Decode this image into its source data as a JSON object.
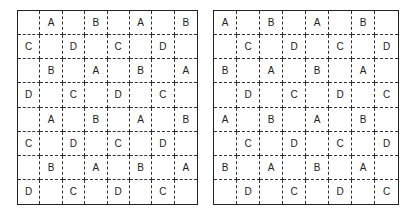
{
  "grids": [
    {
      "name": "left-grid",
      "rows": [
        [
          "",
          "A",
          "",
          "B",
          "",
          "A",
          "",
          "B"
        ],
        [
          "C",
          "",
          "D",
          "",
          "C",
          "",
          "D",
          ""
        ],
        [
          "",
          "B",
          "",
          "A",
          "",
          "B",
          "",
          "A"
        ],
        [
          "D",
          "",
          "C",
          "",
          "D",
          "",
          "C",
          ""
        ],
        [
          "",
          "A",
          "",
          "B",
          "",
          "A",
          "",
          "B"
        ],
        [
          "C",
          "",
          "D",
          "",
          "C",
          "",
          "D",
          ""
        ],
        [
          "",
          "B",
          "",
          "A",
          "",
          "B",
          "",
          "A"
        ],
        [
          "D",
          "",
          "C",
          "",
          "D",
          "",
          "C",
          ""
        ]
      ]
    },
    {
      "name": "right-grid",
      "rows": [
        [
          "A",
          "",
          "B",
          "",
          "A",
          "",
          "B",
          ""
        ],
        [
          "",
          "C",
          "",
          "D",
          "",
          "C",
          "",
          "D"
        ],
        [
          "B",
          "",
          "A",
          "",
          "B",
          "",
          "A",
          ""
        ],
        [
          "",
          "D",
          "",
          "C",
          "",
          "D",
          "",
          "C"
        ],
        [
          "A",
          "",
          "B",
          "",
          "A",
          "",
          "B",
          ""
        ],
        [
          "",
          "C",
          "",
          "D",
          "",
          "C",
          "",
          "D"
        ],
        [
          "B",
          "",
          "A",
          "",
          "B",
          "",
          "A",
          ""
        ],
        [
          "",
          "D",
          "",
          "C",
          "",
          "D",
          "",
          "C"
        ]
      ]
    }
  ]
}
